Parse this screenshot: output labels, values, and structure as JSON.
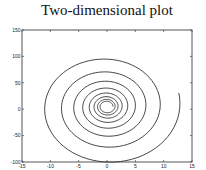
{
  "chart_data": {
    "type": "line",
    "title": "Two-dimensional plot",
    "xlabel": "",
    "ylabel": "",
    "xlim": [
      -15,
      15
    ],
    "ylim": [
      -100,
      150
    ],
    "x_ticks": [
      -15,
      -10,
      -5,
      0,
      5,
      10,
      15
    ],
    "y_ticks": [
      -100,
      -50,
      0,
      50,
      100,
      150
    ],
    "x_tick_labels": [
      "-15",
      "-10",
      "-5",
      "0",
      "5",
      "10",
      "15"
    ],
    "y_tick_labels": [
      "-100",
      "-50",
      "0",
      "50",
      "100",
      "150"
    ],
    "grid": false,
    "legend": null,
    "series": [
      {
        "name": "spiral",
        "color": "#333333",
        "description": "Logarithmic spiral winding counter-clockwise outward from center (~0, 5) for ~8 turns, ending at right side near (12, 28)",
        "parametric": {
          "x": "Ax * exp(k*(t - t_end)) * cos(t)",
          "y": "cy + Ay * exp(k*(t - t_end)) * sin(t)",
          "Ax": 13,
          "Ay": 115,
          "cy": 5,
          "k": 0.05,
          "t_start": 0,
          "t_end": 50.49,
          "samples": 600
        },
        "key_points": [
          {
            "label": "outer top",
            "x": 0,
            "y": 112
          },
          {
            "label": "outer left",
            "x": -10.5,
            "y": 5
          },
          {
            "label": "outer bottom",
            "x": 0,
            "y": -100
          },
          {
            "label": "end",
            "x": 12.2,
            "y": 28
          },
          {
            "label": "center",
            "x": 0,
            "y": 3
          }
        ]
      }
    ]
  },
  "axes": {
    "box_color": "#555555"
  }
}
